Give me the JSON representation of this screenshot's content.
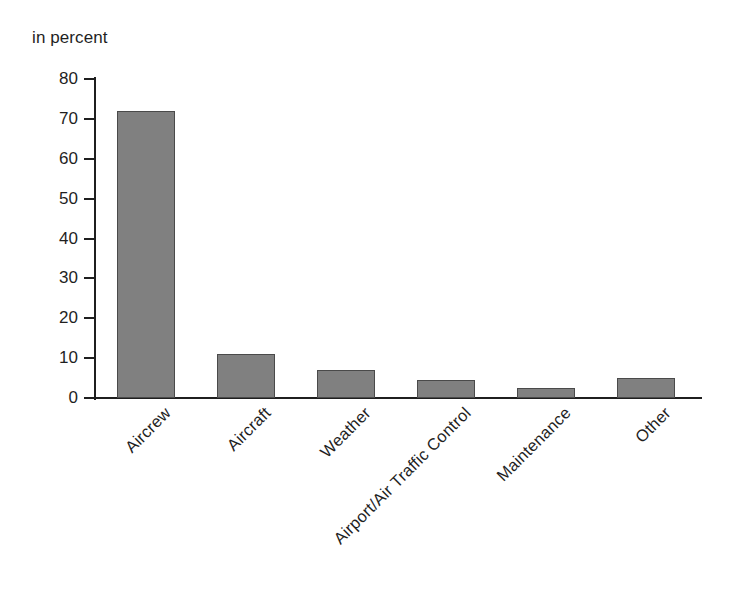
{
  "chart_data": {
    "type": "bar",
    "title": "",
    "subtitle": "",
    "unit_annotation": "in percent",
    "xlabel": "",
    "ylabel": "",
    "ylim": [
      0,
      80
    ],
    "ytick_step": 10,
    "yticks": [
      0,
      10,
      20,
      30,
      40,
      50,
      60,
      70,
      80
    ],
    "ytick_labels": [
      "0",
      "10",
      "20",
      "30",
      "40",
      "50",
      "60",
      "70",
      "80"
    ],
    "grid": false,
    "legend": false,
    "legend_position": "none",
    "xtick_rotation_degrees": -45,
    "categories": [
      "Aircrew",
      "Aircraft",
      "Weather",
      "Airport/Air Traffic Control",
      "Maintenance",
      "Other"
    ],
    "values": [
      72,
      11,
      7,
      4.5,
      2.5,
      5
    ],
    "series": [
      {
        "name": "Share of causes",
        "values": [
          72,
          11,
          7,
          4.5,
          2.5,
          5
        ]
      }
    ],
    "bar_fill_color": "#808080",
    "bar_edge_color": "#4a4a4a",
    "axis_color": "#1f1f1f",
    "background_color": "#ffffff"
  }
}
